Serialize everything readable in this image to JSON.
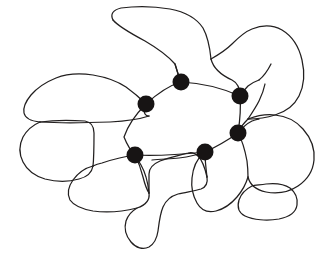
{
  "figure": {
    "type": "line-diagram",
    "background_color": "#ffffff",
    "line_color": "#221f1f",
    "node_color": "#171414",
    "node_radius": 8.5,
    "stroke_width": 1.25,
    "width": 330,
    "height": 256
  },
  "nodes": [
    {
      "id": "n1",
      "label": "junction-top-center",
      "x": 181,
      "y": 82
    },
    {
      "id": "n2",
      "label": "junction-left-upper",
      "x": 146,
      "y": 104
    },
    {
      "id": "n3",
      "label": "junction-right-upper",
      "x": 240,
      "y": 96
    },
    {
      "id": "n4",
      "label": "junction-right-lower",
      "x": 238,
      "y": 133
    },
    {
      "id": "n5",
      "label": "junction-bottom-center",
      "x": 205,
      "y": 152
    },
    {
      "id": "n6",
      "label": "junction-left-lower",
      "x": 135,
      "y": 155
    }
  ],
  "central_grain": {
    "label": "central-grain",
    "path": "M 181 82 C 170 85 158 92 146 104 C 137 112 128 124 124 136 C 129 147 132 152 135 155 C 152 156 175 155 205 152 C 216 147 228 140 238 133 C 240 120 241 107 240 96 C 222 88 201 83 181 82 Z"
  },
  "grains": [
    {
      "id": "g-top",
      "label": "grain-top-center",
      "path": "M 181 82 C 178 76 176 70 175 63 C 168 55 157 47 145 41 C 130 32 118 25 113 20 C 110 14 113 10 120 8 C 134 6 152 6 170 9 C 185 12 196 18 202 27 C 207 36 209 48 210 58 C 212 66 220 74 232 80 C 238 83 240 89 240 96 C 222 88 201 83 181 82 Z"
    },
    {
      "id": "g-top-right",
      "label": "grain-top-right",
      "path": "M 240 96 C 244 88 248 82 254 78 C 260 74 266 70 270 64 C 274 57 277 48 282 42 C 289 35 298 32 306 36 C 314 41 318 50 319 60 C 320 72 318 84 314 94 C 310 103 304 110 296 114 C 286 118 272 119 260 119 C 250 119 243 123 238 133 C 240 120 241 107 240 96 Z"
    },
    {
      "id": "g-upper-left",
      "label": "grain-upper-left",
      "path": "M 146 104 C 140 98 134 93 127 88 C 118 82 106 78 94 76 C 80 74 68 75 58 79 C 48 83 40 89 34 96 C 29 102 26 108 26 113 C 26 118 30 120 38 121 C 52 122 78 122 106 121 C 124 120 136 118 146 116 C 150 112 150 108 146 104 Z"
    },
    {
      "id": "g-left",
      "label": "grain-left-middle",
      "path": "M 38 121 C 32 124 27 129 24 136 C 21 144 21 152 24 160 C 27 168 34 174 43 177 C 53 180 66 180 76 178 C 84 176 89 172 90 166 C 91 158 91 145 91 134 C 91 126 88 122 82 121 C 68 120 52 120 38 121 Z"
    },
    {
      "id": "g-left-lower",
      "label": "grain-left-lower",
      "path": "M 90 166 C 84 168 78 172 74 178 C 70 184 68 190 70 196 C 73 202 80 206 90 208 C 104 210 122 209 135 206 C 145 203 150 198 149 192 C 148 184 146 174 143 167 C 140 161 137 158 135 155 C 120 156 104 160 90 166 Z"
    },
    {
      "id": "g-bottom-center",
      "label": "grain-bottom-center",
      "path": "M 135 206 C 130 208 126 212 124 218 C 122 225 123 232 127 239 C 131 246 138 250 145 249 C 151 248 155 243 157 236 C 159 228 160 218 162 210 C 164 203 168 199 174 197 C 182 195 192 194 198 192 C 203 190 205 186 204 180 C 202 170 198 160 193 155 C 190 152 187 151 184 152 C 174 154 160 157 149 192 C 148 199 143 204 135 206 Z"
    },
    {
      "id": "g-bottom-mid-right",
      "label": "grain-bottom-center-right",
      "path": "M 205 152 C 200 156 196 162 194 170 C 192 180 193 190 197 199 C 201 208 208 214 217 216 C 227 218 237 214 243 206 C 248 198 250 187 249 176 C 248 165 244 156 238 150 C 232 145 222 144 214 147 C 210 148 207 150 205 152 Z"
    },
    {
      "id": "g-right-lower",
      "label": "grain-right-lower",
      "path": "M 238 133 C 244 130 252 128 260 128 C 272 128 284 132 292 139 C 300 146 305 155 305 164 C 305 173 300 180 292 185 C 283 190 271 192 261 190 C 253 188 249 183 248 176 C 247 166 245 156 241 149 C 240 142 239 137 238 133 Z"
    },
    {
      "id": "g-bottom-right",
      "label": "grain-bottom-right",
      "path": "M 248 190 C 244 194 241 199 240 205 C 239 211 241 216 246 218 C 254 221 268 221 280 219 C 290 217 296 213 297 207 C 298 200 296 194 292 190 C 287 186 278 185 268 186 C 259 187 252 188 248 190 Z"
    }
  ],
  "edges": [
    {
      "from": "n1",
      "to": "n2",
      "label": "boundary-n1-n2"
    },
    {
      "from": "n2",
      "to": "n6",
      "label": "boundary-n2-n6"
    },
    {
      "from": "n6",
      "to": "n5",
      "label": "boundary-n6-n5"
    },
    {
      "from": "n5",
      "to": "n4",
      "label": "boundary-n5-n4"
    },
    {
      "from": "n4",
      "to": "n3",
      "label": "boundary-n4-n3"
    },
    {
      "from": "n3",
      "to": "n1",
      "label": "boundary-n3-n1"
    }
  ],
  "boundary_paths": [
    {
      "id": "b01",
      "label": "outline-top-grain-upper",
      "d": "M 113 20 C 110 14 113 10 121 8 C 135 6 153 6 170 9 C 186 12 197 19 203 28 C 208 37 210 49 211 59"
    },
    {
      "id": "b02",
      "label": "outline-top-grain-left",
      "d": "M 113 20 C 118 26 130 33 145 41 C 157 48 168 56 175 64 C 177 71 179 77 181 82"
    },
    {
      "id": "b03",
      "label": "outline-top-grain-right",
      "d": "M 211 59 C 213 67 221 75 232 80 C 238 83 240 89 240 96"
    },
    {
      "id": "b04",
      "label": "outline-top-right-grain",
      "d": "M 211 59 C 218 55 226 50 232 44 C 238 38 244 32 252 29 C 262 25 273 25 282 30 C 292 36 299 47 302 60 C 305 73 304 86 299 96 C 294 106 285 112 275 115 C 266 118 256 119 248 119"
    },
    {
      "id": "b05",
      "label": "outline-right-grain-outer",
      "d": "M 248 119 C 256 116 266 114 275 115 C 286 116 296 121 303 129 C 311 138 315 149 314 160 C 313 171 307 180 298 186 C 289 192 277 194 266 192 C 256 190 250 185 248 177"
    },
    {
      "id": "b06",
      "label": "outline-right-lower-connector",
      "d": "M 248 119 C 244 123 240 127 238 133"
    },
    {
      "id": "b07",
      "label": "outline-right-inner-lower",
      "d": "M 238 133 C 242 140 245 150 247 161 C 248 169 248 174 248 177"
    },
    {
      "id": "b08",
      "label": "outline-bottom-right-grain",
      "d": "M 248 177 C 246 184 242 191 237 197 C 231 204 224 209 216 211 C 208 213 201 210 197 203 C 193 196 191 187 192 178 C 193 168 197 159 203 154"
    },
    {
      "id": "b09",
      "label": "outline-bottom-right-small",
      "d": "M 252 186 C 246 189 241 194 239 200 C 237 207 239 213 245 216 C 253 220 267 221 279 219 C 289 217 296 212 297 205 C 298 198 295 192 290 188 C 284 184 275 183 266 184 C 259 185 254 185 252 186"
    },
    {
      "id": "b10",
      "label": "outline-upper-left-grain-top",
      "d": "M 146 104 C 140 98 133 92 126 87 C 117 81 105 77 93 75 C 79 73 66 74 56 78 C 46 82 37 88 31 95 C 26 101 23 108 24 113 C 25 118 31 121 40 122"
    },
    {
      "id": "b11",
      "label": "outline-upper-left-grain-bottom",
      "d": "M 40 122 C 56 123 82 123 110 122 C 128 121 140 119 149 116"
    },
    {
      "id": "b12",
      "label": "outline-left-grain",
      "d": "M 40 122 C 33 125 27 130 23 137 C 19 145 19 154 23 162 C 27 170 35 176 45 179 C 56 182 69 182 79 179 C 87 177 92 172 93 166"
    },
    {
      "id": "b13",
      "label": "outline-left-grain-inner",
      "d": "M 93 166 C 94 157 94 144 94 133 C 94 126 91 122 85 121 C 70 120 54 120 40 122"
    },
    {
      "id": "b14",
      "label": "outline-left-lower-grain",
      "d": "M 93 166 C 85 168 78 173 73 180 C 68 187 67 194 70 200 C 74 206 82 209 93 211 C 108 213 125 211 137 208 C 146 205 150 200 149 193"
    },
    {
      "id": "b15",
      "label": "outline-left-lower-to-node",
      "d": "M 149 193 C 148 183 145 172 141 165 C 138 160 136 157 135 155"
    },
    {
      "id": "b16",
      "label": "outline-bottom-middle-spur",
      "d": "M 137 208 C 132 211 128 215 126 221 C 124 228 126 236 131 242 C 136 248 143 250 149 247 C 154 244 157 238 158 231 C 159 223 160 214 163 207 C 166 200 171 196 178 194 C 186 192 195 191 201 189 C 206 187 208 183 207 177"
    },
    {
      "id": "b17",
      "label": "outline-bottom-middle-upper",
      "d": "M 207 177 C 205 168 202 160 198 156 C 195 153 191 152 188 153 C 181 155 170 157 160 161 C 153 164 149 168 149 174 C 149 182 149 189 149 193"
    },
    {
      "id": "b18",
      "label": "central-grain-edge-n1-n2",
      "d": "M 181 82 C 171 85 159 92 146 104"
    },
    {
      "id": "b19",
      "label": "central-grain-edge-n2-n6",
      "d": "M 146 104 C 137 113 128 125 124 137 C 128 147 132 152 135 155"
    },
    {
      "id": "b20",
      "label": "central-grain-edge-n6-n5",
      "d": "M 135 155 C 153 156 176 155 205 152"
    },
    {
      "id": "b21",
      "label": "central-grain-edge-n5-n4",
      "d": "M 205 152 C 216 147 228 140 238 133"
    },
    {
      "id": "b22",
      "label": "central-grain-edge-n4-n3",
      "d": "M 238 133 C 240 120 241 107 240 96"
    },
    {
      "id": "b23",
      "label": "central-grain-edge-n3-n1",
      "d": "M 240 96 C 222 88 201 83 181 82"
    },
    {
      "id": "b24",
      "label": "outline-left-of-n6",
      "d": "M 135 155 C 127 156 114 159 102 163 C 97 164 95 165 93 166"
    },
    {
      "id": "b25",
      "label": "outline-n6-to-bottom",
      "d": "M 135 155 C 138 161 141 169 143 177 C 145 185 147 190 149 193"
    },
    {
      "id": "b26",
      "label": "outline-n5-downward",
      "d": "M 205 152 C 205 161 206 169 207 177"
    },
    {
      "id": "b27",
      "label": "outline-n5-to-left-lower",
      "d": "M 205 152 C 197 155 187 157 179 158 C 170 159 161 159 152 160"
    },
    {
      "id": "b28",
      "label": "outline-n1-stub-up",
      "d": "M 181 82 C 179 77 177 71 175 64"
    },
    {
      "id": "b29",
      "label": "outline-n2-stub-left",
      "d": "M 146 104 C 144 107 143 110 145 114 C 146 116 147 116 149 116"
    },
    {
      "id": "b30",
      "label": "outline-n3-stub-right",
      "d": "M 240 96 C 243 92 245 89 248 86 C 252 83 256 81 259 80"
    },
    {
      "id": "b31",
      "label": "outline-upper-mid-connector",
      "d": "M 259 80 C 264 76 268 70 271 64"
    },
    {
      "id": "b32",
      "label": "outline-n4-stub",
      "d": "M 238 133 C 242 128 246 124 252 121 C 255 120 257 119 259 119"
    },
    {
      "id": "b33",
      "label": "outline-top-grain-right-flap",
      "d": "M 248 119 C 252 113 256 107 259 101 C 262 95 264 89 265 84"
    }
  ],
  "caption": ""
}
